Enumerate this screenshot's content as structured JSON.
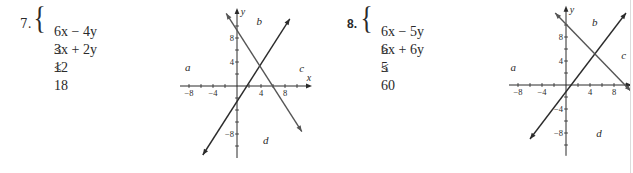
{
  "problems": [
    {
      "number": "7.",
      "number_bold": false,
      "inequalities": [
        {
          "lhs": "6x − 4y",
          "op": "≤",
          "rhs": "12"
        },
        {
          "lhs": "3x + 2y",
          "op": "≤",
          "rhs": "18"
        }
      ],
      "graph": {
        "origin_px": [
          237,
          86
        ],
        "px_per_unit": 6,
        "x_range": [
          -9.5,
          12.5
        ],
        "y_range": [
          -12,
          13
        ],
        "x_ticks": [
          -8,
          -6,
          -4,
          -2,
          2,
          4,
          6,
          8,
          10
        ],
        "y_ticks": [
          -10,
          -8,
          -6,
          -4,
          -2,
          2,
          4,
          6,
          8,
          10
        ],
        "x_tick_labels": [
          "-8",
          "-4",
          "4",
          "8"
        ],
        "y_tick_labels": [
          "8",
          "4",
          "-8"
        ],
        "axis_labels": {
          "x": "x",
          "y": "y"
        },
        "lines": [
          {
            "equation": "6x − 4y = 12",
            "from": [
              -5.7,
              -11.5
            ],
            "to": [
              8.8,
              11.2
            ]
          },
          {
            "equation": "3x + 2y = 18",
            "from": [
              -1.8,
              12.1
            ],
            "to": [
              10.8,
              -7.6
            ]
          }
        ],
        "intersection": [
          4,
          3
        ],
        "regions": [
          {
            "label": "a",
            "pos": [
              -8.2,
              3.2
            ]
          },
          {
            "label": "b",
            "pos": [
              3.7,
              10.8
            ]
          },
          {
            "label": "c",
            "pos": [
              10.8,
              3.0
            ]
          },
          {
            "label": "d",
            "pos": [
              4.8,
              -9.0
            ]
          }
        ]
      }
    },
    {
      "number": "8.",
      "number_bold": true,
      "inequalities": [
        {
          "lhs": "6x − 5y",
          "op": "≥",
          "rhs": "5"
        },
        {
          "lhs": "6x + 6y",
          "op": "≤",
          "rhs": "60"
        }
      ],
      "graph": {
        "origin_px": [
          566,
          85
        ],
        "px_per_unit": 6,
        "x_range": [
          -9.5,
          11
        ],
        "y_range": [
          -11.8,
          13.2
        ],
        "x_ticks": [
          -8,
          -6,
          -4,
          -2,
          2,
          4,
          6,
          8,
          10
        ],
        "y_ticks": [
          -10,
          -8,
          -6,
          -4,
          -2,
          2,
          4,
          6,
          8,
          10
        ],
        "x_tick_labels": [
          "-8",
          "-4",
          "4",
          "8"
        ],
        "y_tick_labels": [
          "8",
          "4",
          "-4",
          "-8"
        ],
        "axis_labels": {
          "y": "y"
        },
        "lines": [
          {
            "equation": "6x − 5y = 5",
            "from": [
              -6.0,
              -9.0
            ],
            "to": [
              10.0,
              12.0
            ]
          },
          {
            "equation": "6x + 6y = 60",
            "from": [
              -1.8,
              12.0
            ],
            "to": [
              10.8,
              -1.0
            ]
          }
        ],
        "intersection": [
          5,
          5
        ],
        "regions": [
          {
            "label": "a",
            "pos": [
              -8.8,
              3.0
            ]
          },
          {
            "label": "b",
            "pos": [
              4.8,
              10.5
            ]
          },
          {
            "label": "c",
            "pos": [
              9.6,
              5.0
            ]
          },
          {
            "label": "d",
            "pos": [
              5.5,
              -8.0
            ]
          }
        ]
      }
    }
  ],
  "colors": {
    "ink": "#2a2a2a",
    "line_dark": "#2b2b2b",
    "line_gray": "#555555"
  }
}
